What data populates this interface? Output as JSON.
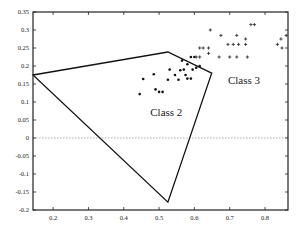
{
  "chart_data": {
    "type": "scatter",
    "title": "",
    "xlabel": "",
    "ylabel": "",
    "xlim": [
      0.143,
      0.865
    ],
    "ylim": [
      -0.2,
      0.35
    ],
    "grid": false,
    "x_ticks": [
      0.2,
      0.3,
      0.4,
      0.5,
      0.6,
      0.7,
      0.8
    ],
    "x_tick_labels": [
      "0.2",
      "0.3",
      "0.4",
      "0.5",
      "0.6",
      "0.7",
      "0.8"
    ],
    "y_ticks": [
      0.35,
      0.3,
      0.25,
      0.2,
      0.15,
      0.1,
      0.05,
      0,
      -0.05,
      -0.1,
      -0.15,
      -0.2
    ],
    "y_tick_labels": [
      "0.35",
      "0.3",
      "0.25",
      "0.2",
      "0.15",
      "0.1",
      "0.05",
      "0",
      "-0.05",
      "-0.1",
      "-0.15",
      "-0.2"
    ],
    "zero_line": {
      "y": 0,
      "style": "dotted"
    },
    "annotations": [
      {
        "text": "Class 2",
        "x": 0.475,
        "y": 0.06
      },
      {
        "text": "Class 3",
        "x": 0.695,
        "y": 0.15
      }
    ],
    "polygon": {
      "name": "Class 2 region",
      "vertices": [
        [
          0.143,
          0.175
        ],
        [
          0.525,
          0.239
        ],
        [
          0.649,
          0.18
        ],
        [
          0.525,
          -0.178
        ]
      ]
    },
    "series": [
      {
        "name": "Class 2",
        "marker": "*",
        "points": [
          [
            0.445,
            0.122
          ],
          [
            0.455,
            0.164
          ],
          [
            0.485,
            0.177
          ],
          [
            0.49,
            0.135
          ],
          [
            0.5,
            0.128
          ],
          [
            0.51,
            0.128
          ],
          [
            0.525,
            0.162
          ],
          [
            0.53,
            0.19
          ],
          [
            0.545,
            0.175
          ],
          [
            0.555,
            0.162
          ],
          [
            0.56,
            0.188
          ],
          [
            0.57,
            0.19
          ],
          [
            0.575,
            0.175
          ],
          [
            0.58,
            0.165
          ],
          [
            0.58,
            0.205
          ],
          [
            0.59,
            0.165
          ],
          [
            0.595,
            0.19
          ],
          [
            0.605,
            0.195
          ],
          [
            0.615,
            0.2
          ],
          [
            0.59,
            0.225
          ],
          [
            0.6,
            0.225
          ],
          [
            0.565,
            0.215
          ]
        ]
      },
      {
        "name": "Class 3",
        "marker": "+",
        "points": [
          [
            0.605,
            0.225
          ],
          [
            0.615,
            0.225
          ],
          [
            0.615,
            0.25
          ],
          [
            0.625,
            0.25
          ],
          [
            0.64,
            0.25
          ],
          [
            0.64,
            0.235
          ],
          [
            0.645,
            0.3
          ],
          [
            0.67,
            0.225
          ],
          [
            0.675,
            0.285
          ],
          [
            0.695,
            0.26
          ],
          [
            0.71,
            0.26
          ],
          [
            0.72,
            0.285
          ],
          [
            0.725,
            0.26
          ],
          [
            0.72,
            0.225
          ],
          [
            0.7,
            0.225
          ],
          [
            0.745,
            0.26
          ],
          [
            0.75,
            0.225
          ],
          [
            0.76,
            0.315
          ],
          [
            0.77,
            0.315
          ],
          [
            0.745,
            0.275
          ],
          [
            0.835,
            0.26
          ],
          [
            0.845,
            0.275
          ],
          [
            0.848,
            0.25
          ],
          [
            0.86,
            0.285
          ]
        ]
      }
    ]
  },
  "labels": {
    "class2": "Class 2",
    "class3": "Class 3"
  }
}
